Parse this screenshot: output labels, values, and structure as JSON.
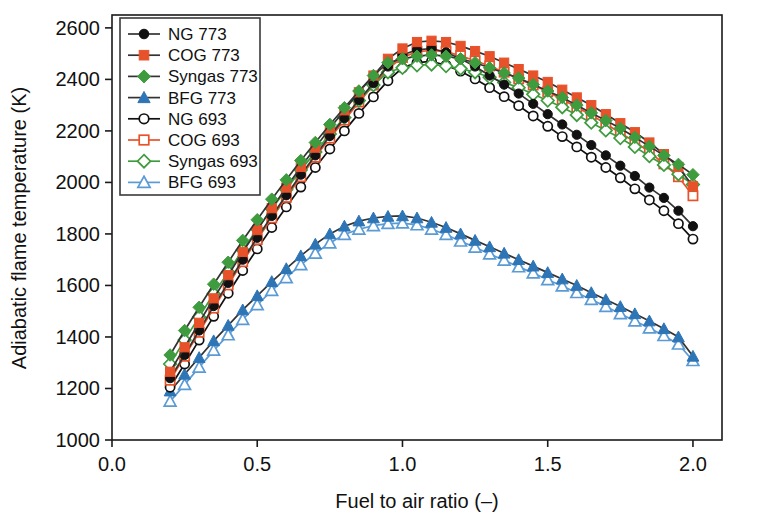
{
  "chart_data": {
    "type": "line",
    "title": "",
    "xlabel": "Fuel to air ratio (–)",
    "ylabel": "Adiabatic flame temperature (K)",
    "xlim": [
      0.0,
      2.1
    ],
    "ylim": [
      1000,
      2650
    ],
    "xticks": [
      "0.0",
      "0.5",
      "1.0",
      "1.5",
      "2.0"
    ],
    "xtick_values": [
      0.0,
      0.5,
      1.0,
      1.5,
      2.0
    ],
    "yticks": [
      "1000",
      "1200",
      "1400",
      "1600",
      "1800",
      "2000",
      "2200",
      "2400",
      "2600"
    ],
    "ytick_values": [
      1000,
      1200,
      1400,
      1600,
      1800,
      2000,
      2200,
      2400,
      2600
    ],
    "grid": false,
    "legend_position": "upper-left",
    "x": [
      0.2,
      0.25,
      0.3,
      0.35,
      0.4,
      0.45,
      0.5,
      0.55,
      0.6,
      0.65,
      0.7,
      0.75,
      0.8,
      0.85,
      0.9,
      0.95,
      1.0,
      1.05,
      1.1,
      1.15,
      1.2,
      1.25,
      1.3,
      1.35,
      1.4,
      1.45,
      1.5,
      1.55,
      1.6,
      1.65,
      1.7,
      1.75,
      1.8,
      1.85,
      1.9,
      1.95,
      2.0
    ],
    "series": [
      {
        "name": "NG 773",
        "color": "#111111",
        "marker": "circle",
        "filled": true,
        "values": [
          1240,
          1330,
          1425,
          1520,
          1610,
          1700,
          1785,
          1870,
          1950,
          2030,
          2105,
          2180,
          2250,
          2320,
          2385,
          2450,
          2495,
          2515,
          2520,
          2505,
          2480,
          2450,
          2415,
          2380,
          2345,
          2305,
          2265,
          2225,
          2185,
          2145,
          2105,
          2065,
          2025,
          1980,
          1940,
          1890,
          1830
        ]
      },
      {
        "name": "COG 773",
        "color": "#E8522A",
        "marker": "square",
        "filled": true,
        "values": [
          1265,
          1360,
          1455,
          1550,
          1640,
          1730,
          1815,
          1900,
          1980,
          2060,
          2135,
          2210,
          2280,
          2350,
          2415,
          2480,
          2520,
          2545,
          2550,
          2545,
          2530,
          2510,
          2490,
          2465,
          2440,
          2415,
          2390,
          2360,
          2330,
          2300,
          2265,
          2230,
          2195,
          2155,
          2110,
          2060,
          1985
        ]
      },
      {
        "name": "Syngas 773",
        "color": "#3E9B3E",
        "marker": "diamond",
        "filled": true,
        "values": [
          1330,
          1425,
          1515,
          1605,
          1690,
          1775,
          1855,
          1935,
          2010,
          2085,
          2155,
          2225,
          2290,
          2355,
          2415,
          2465,
          2480,
          2490,
          2495,
          2490,
          2480,
          2465,
          2445,
          2425,
          2405,
          2380,
          2355,
          2330,
          2300,
          2270,
          2240,
          2210,
          2175,
          2140,
          2105,
          2070,
          2030
        ]
      },
      {
        "name": "BFG 773",
        "color": "#2E75B6",
        "marker": "triangle",
        "filled": true,
        "values": [
          1190,
          1255,
          1320,
          1385,
          1445,
          1505,
          1560,
          1615,
          1665,
          1715,
          1760,
          1800,
          1830,
          1850,
          1862,
          1868,
          1870,
          1862,
          1845,
          1825,
          1800,
          1775,
          1750,
          1725,
          1700,
          1675,
          1650,
          1625,
          1600,
          1572,
          1545,
          1518,
          1490,
          1462,
          1432,
          1400,
          1325
        ]
      },
      {
        "name": "NG 693",
        "color": "#111111",
        "marker": "circle",
        "filled": false,
        "values": [
          1205,
          1295,
          1388,
          1480,
          1570,
          1658,
          1742,
          1825,
          1905,
          1982,
          2058,
          2130,
          2200,
          2268,
          2332,
          2395,
          2445,
          2465,
          2470,
          2455,
          2432,
          2402,
          2368,
          2333,
          2298,
          2258,
          2218,
          2178,
          2138,
          2098,
          2058,
          2018,
          1975,
          1932,
          1890,
          1840,
          1780
        ]
      },
      {
        "name": "COG 693",
        "color": "#E8522A",
        "marker": "square",
        "filled": false,
        "values": [
          1232,
          1325,
          1418,
          1512,
          1602,
          1692,
          1778,
          1862,
          1942,
          2022,
          2098,
          2172,
          2242,
          2312,
          2378,
          2442,
          2485,
          2508,
          2512,
          2508,
          2492,
          2472,
          2452,
          2428,
          2402,
          2378,
          2352,
          2322,
          2292,
          2262,
          2228,
          2192,
          2158,
          2118,
          2072,
          2022,
          1948
        ]
      },
      {
        "name": "Syngas 693",
        "color": "#3E9B3E",
        "marker": "diamond",
        "filled": false,
        "values": [
          1295,
          1388,
          1478,
          1568,
          1652,
          1738,
          1818,
          1898,
          1972,
          2048,
          2118,
          2188,
          2252,
          2318,
          2378,
          2428,
          2445,
          2455,
          2458,
          2452,
          2442,
          2428,
          2408,
          2388,
          2368,
          2342,
          2318,
          2292,
          2262,
          2232,
          2202,
          2172,
          2138,
          2102,
          2068,
          2032,
          1992
        ]
      },
      {
        "name": "BFG 693",
        "color": "#5B9BD5",
        "marker": "triangle",
        "filled": false,
        "values": [
          1150,
          1215,
          1282,
          1348,
          1408,
          1468,
          1525,
          1580,
          1630,
          1680,
          1725,
          1765,
          1798,
          1818,
          1832,
          1840,
          1842,
          1835,
          1818,
          1798,
          1772,
          1748,
          1722,
          1698,
          1672,
          1648,
          1622,
          1598,
          1572,
          1545,
          1518,
          1490,
          1462,
          1435,
          1405,
          1372,
          1308
        ]
      }
    ]
  },
  "legend": {
    "entries": [
      {
        "label": "NG 773"
      },
      {
        "label": "COG 773"
      },
      {
        "label": "Syngas 773"
      },
      {
        "label": "BFG 773"
      },
      {
        "label": "NG 693"
      },
      {
        "label": "COG 693"
      },
      {
        "label": "Syngas 693"
      },
      {
        "label": "BFG 693"
      }
    ]
  }
}
